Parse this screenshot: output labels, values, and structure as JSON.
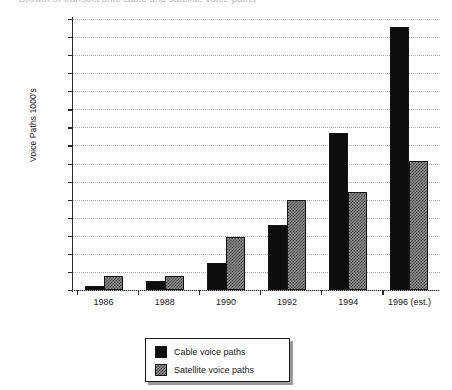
{
  "chart_data": {
    "type": "bar",
    "title": "Growth of transoceanic cable and satellite voice paths",
    "xlabel": "",
    "ylabel": "Voice Paths 1000's",
    "categories": [
      "1986",
      "1988",
      "1990",
      "1992",
      "1994",
      "1996 (est.)"
    ],
    "series": [
      {
        "name": "Cable voice paths",
        "color": "#0d0d0d",
        "values": [
          20,
          50,
          150,
          360,
          870,
          1455
        ]
      },
      {
        "name": "Satellite voice paths",
        "color": "#8a8a8a",
        "values": [
          75,
          75,
          295,
          500,
          540,
          715
        ]
      }
    ],
    "ylim": [
      0,
      1500
    ],
    "ytick_step": 100,
    "yticks": [
      0,
      100,
      200,
      300,
      400,
      500,
      600,
      700,
      800,
      900,
      1000,
      1100,
      1200,
      1300,
      1400,
      1500
    ],
    "ytick_labels": [
      "0",
      "100",
      "200",
      "300",
      "400",
      "500",
      "600",
      "700",
      "800",
      "900",
      "1000",
      "1100",
      "1200",
      "1300",
      "1400",
      "1500"
    ],
    "grid": true,
    "grid_style": "dotted-horizontal",
    "legend_position": "bottom-center"
  },
  "legend": {
    "items": [
      {
        "label": "Cable voice paths",
        "color": "#0d0d0d"
      },
      {
        "label": "Satellite voice paths",
        "color": "#8a8a8a"
      }
    ]
  }
}
